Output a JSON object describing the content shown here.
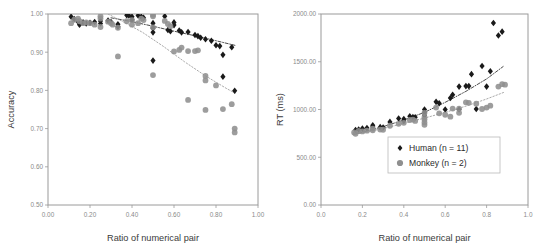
{
  "figure": {
    "background": "#ffffff",
    "human_color": "#1a1a1a",
    "monkey_color": "#8f8f8f",
    "frame_color": "#9a9a9a",
    "tick_color": "#8a8a8a"
  },
  "legend": {
    "position": "inside-bottom-right",
    "entries": [
      {
        "label": "Human (n = 11)",
        "marker": "diamond",
        "color": "#1a1a1a"
      },
      {
        "label": "Monkey (n = 2)",
        "marker": "circle",
        "color": "#8f8f8f"
      }
    ]
  },
  "chart_data": [
    {
      "type": "scatter",
      "panel": "left",
      "title": "",
      "xlabel": "Ratio of numerical pair",
      "ylabel": "Accuracy",
      "xlim": [
        0.0,
        1.0
      ],
      "ylim": [
        0.5,
        1.0
      ],
      "xticks": [
        0.0,
        0.2,
        0.4,
        0.6,
        0.8,
        1.0
      ],
      "xticklabels": [
        "0.00",
        "0.20",
        "0.40",
        "0.60",
        "0.80",
        "1.00"
      ],
      "yticks": [
        0.5,
        0.6,
        0.7,
        0.8,
        0.9,
        1.0
      ],
      "yticklabels": [
        "0.50",
        "0.60",
        "0.70",
        "0.80",
        "0.90",
        "1.00"
      ],
      "grid": false,
      "series": [
        {
          "name": "Human (n = 11)",
          "marker": "diamond",
          "color": "#1a1a1a",
          "points": [
            [
              0.11,
              0.993
            ],
            [
              0.125,
              0.987
            ],
            [
              0.143,
              0.98
            ],
            [
              0.15,
              0.972
            ],
            [
              0.167,
              0.978
            ],
            [
              0.182,
              0.975
            ],
            [
              0.2,
              0.977
            ],
            [
              0.222,
              0.979
            ],
            [
              0.25,
              0.982
            ],
            [
              0.25,
              0.975
            ],
            [
              0.286,
              0.983
            ],
            [
              0.3,
              0.979
            ],
            [
              0.333,
              0.973
            ],
            [
              0.333,
              0.967
            ],
            [
              0.375,
              0.997
            ],
            [
              0.385,
              0.996
            ],
            [
              0.4,
              0.993
            ],
            [
              0.4,
              0.985
            ],
            [
              0.429,
              0.996
            ],
            [
              0.444,
              0.993
            ],
            [
              0.455,
              0.99
            ],
            [
              0.5,
              0.976
            ],
            [
              0.5,
              0.963
            ],
            [
              0.5,
              0.952
            ],
            [
              0.5,
              0.878
            ],
            [
              0.556,
              0.994
            ],
            [
              0.571,
              0.958
            ],
            [
              0.583,
              0.955
            ],
            [
              0.6,
              0.978
            ],
            [
              0.6,
              0.971
            ],
            [
              0.625,
              0.957
            ],
            [
              0.636,
              0.952
            ],
            [
              0.667,
              0.953
            ],
            [
              0.7,
              0.945
            ],
            [
              0.714,
              0.942
            ],
            [
              0.727,
              0.938
            ],
            [
              0.75,
              0.934
            ],
            [
              0.778,
              0.93
            ],
            [
              0.8,
              0.918
            ],
            [
              0.818,
              0.916
            ],
            [
              0.833,
              0.893
            ],
            [
              0.833,
              0.836
            ],
            [
              0.875,
              0.913
            ],
            [
              0.889,
              0.799
            ]
          ]
        },
        {
          "name": "Monkey (n = 2)",
          "marker": "circle",
          "color": "#8f8f8f",
          "points": [
            [
              0.11,
              0.976
            ],
            [
              0.125,
              0.985
            ],
            [
              0.143,
              0.988
            ],
            [
              0.15,
              0.981
            ],
            [
              0.167,
              0.976
            ],
            [
              0.182,
              0.978
            ],
            [
              0.2,
              0.976
            ],
            [
              0.222,
              0.972
            ],
            [
              0.25,
              0.994
            ],
            [
              0.25,
              0.988
            ],
            [
              0.25,
              0.966
            ],
            [
              0.286,
              0.98
            ],
            [
              0.3,
              0.976
            ],
            [
              0.308,
              0.972
            ],
            [
              0.333,
              0.964
            ],
            [
              0.333,
              0.889
            ],
            [
              0.375,
              0.981
            ],
            [
              0.4,
              0.984
            ],
            [
              0.4,
              0.972
            ],
            [
              0.429,
              0.976
            ],
            [
              0.444,
              0.988
            ],
            [
              0.455,
              0.984
            ],
            [
              0.5,
              0.998
            ],
            [
              0.5,
              0.994
            ],
            [
              0.5,
              0.965
            ],
            [
              0.5,
              0.84
            ],
            [
              0.556,
              0.982
            ],
            [
              0.571,
              0.974
            ],
            [
              0.583,
              0.968
            ],
            [
              0.6,
              0.902
            ],
            [
              0.625,
              0.906
            ],
            [
              0.636,
              0.912
            ],
            [
              0.667,
              0.903
            ],
            [
              0.667,
              0.775
            ],
            [
              0.7,
              0.903
            ],
            [
              0.714,
              0.905
            ],
            [
              0.75,
              0.838
            ],
            [
              0.75,
              0.826
            ],
            [
              0.75,
              0.749
            ],
            [
              0.8,
              0.813
            ],
            [
              0.833,
              0.751
            ],
            [
              0.875,
              0.764
            ],
            [
              0.889,
              0.7
            ],
            [
              0.889,
              0.69
            ]
          ]
        }
      ],
      "trendlines": [
        {
          "name": "Human trend",
          "style": "dash-dot",
          "color": "#2b2b2b",
          "points": [
            [
              0.3,
              0.99
            ],
            [
              0.4,
              0.98
            ],
            [
              0.5,
              0.968
            ],
            [
              0.6,
              0.955
            ],
            [
              0.7,
              0.943
            ],
            [
              0.8,
              0.93
            ],
            [
              0.89,
              0.918
            ]
          ]
        },
        {
          "name": "Monkey trend",
          "style": "dotted",
          "color": "#9a9a9a",
          "points": [
            [
              0.16,
              1.035
            ],
            [
              0.25,
              1.01
            ],
            [
              0.35,
              0.982
            ],
            [
              0.45,
              0.952
            ],
            [
              0.55,
              0.915
            ],
            [
              0.65,
              0.875
            ],
            [
              0.75,
              0.838
            ],
            [
              0.85,
              0.805
            ],
            [
              0.89,
              0.793
            ]
          ]
        }
      ]
    },
    {
      "type": "scatter",
      "panel": "right",
      "title": "",
      "xlabel": "Ratio of numerical pair",
      "ylabel": "RT (ms)",
      "xlim": [
        0.0,
        1.0
      ],
      "ylim": [
        0.0,
        2000.0
      ],
      "xticks": [
        0.0,
        0.2,
        0.4,
        0.6,
        0.8,
        1.0
      ],
      "xticklabels": [
        "0.0",
        "0.2",
        "0.4",
        "0.6",
        "0.8",
        "1.0"
      ],
      "yticks": [
        0.0,
        500.0,
        1000.0,
        1500.0,
        2000.0
      ],
      "yticklabels": [
        "0.00",
        "500.00",
        "1000.00",
        "1500.00",
        "2000.00"
      ],
      "grid": false,
      "series": [
        {
          "name": "Human (n = 11)",
          "marker": "diamond",
          "color": "#1a1a1a",
          "points": [
            [
              0.167,
              785
            ],
            [
              0.182,
              790
            ],
            [
              0.2,
              800
            ],
            [
              0.222,
              805
            ],
            [
              0.25,
              835
            ],
            [
              0.25,
              820
            ],
            [
              0.286,
              815
            ],
            [
              0.3,
              812
            ],
            [
              0.333,
              870
            ],
            [
              0.375,
              905
            ],
            [
              0.4,
              900
            ],
            [
              0.4,
              880
            ],
            [
              0.429,
              930
            ],
            [
              0.444,
              920
            ],
            [
              0.455,
              918
            ],
            [
              0.5,
              1000
            ],
            [
              0.5,
              965
            ],
            [
              0.5,
              940
            ],
            [
              0.556,
              1080
            ],
            [
              0.571,
              1065
            ],
            [
              0.6,
              1000
            ],
            [
              0.625,
              1120
            ],
            [
              0.636,
              1155
            ],
            [
              0.667,
              1240
            ],
            [
              0.667,
              1000
            ],
            [
              0.7,
              1245
            ],
            [
              0.714,
              1245
            ],
            [
              0.727,
              1370
            ],
            [
              0.75,
              1005
            ],
            [
              0.778,
              1455
            ],
            [
              0.8,
              1240
            ],
            [
              0.818,
              1400
            ],
            [
              0.833,
              1905
            ],
            [
              0.857,
              1775
            ],
            [
              0.875,
              1815
            ]
          ]
        },
        {
          "name": "Monkey (n = 2)",
          "marker": "circle",
          "color": "#8f8f8f",
          "points": [
            [
              0.16,
              760
            ],
            [
              0.167,
              745
            ],
            [
              0.182,
              775
            ],
            [
              0.2,
              770
            ],
            [
              0.222,
              778
            ],
            [
              0.25,
              800
            ],
            [
              0.25,
              782
            ],
            [
              0.286,
              790
            ],
            [
              0.3,
              788
            ],
            [
              0.333,
              830
            ],
            [
              0.375,
              850
            ],
            [
              0.4,
              860
            ],
            [
              0.429,
              890
            ],
            [
              0.444,
              895
            ],
            [
              0.455,
              880
            ],
            [
              0.5,
              965
            ],
            [
              0.5,
              920
            ],
            [
              0.5,
              895
            ],
            [
              0.5,
              865
            ],
            [
              0.5,
              840
            ],
            [
              0.556,
              1020
            ],
            [
              0.571,
              960
            ],
            [
              0.6,
              945
            ],
            [
              0.625,
              925
            ],
            [
              0.636,
              1010
            ],
            [
              0.667,
              1010
            ],
            [
              0.667,
              965
            ],
            [
              0.7,
              1075
            ],
            [
              0.714,
              1070
            ],
            [
              0.75,
              1060
            ],
            [
              0.778,
              1005
            ],
            [
              0.8,
              1020
            ],
            [
              0.818,
              1040
            ],
            [
              0.857,
              1240
            ],
            [
              0.875,
              1265
            ],
            [
              0.889,
              1260
            ]
          ]
        }
      ],
      "trendlines": [
        {
          "name": "Human trend",
          "style": "dash-dot",
          "color": "#2b2b2b",
          "points": [
            [
              0.17,
              745
            ],
            [
              0.3,
              820
            ],
            [
              0.4,
              890
            ],
            [
              0.5,
              970
            ],
            [
              0.6,
              1075
            ],
            [
              0.7,
              1190
            ],
            [
              0.8,
              1320
            ],
            [
              0.88,
              1450
            ]
          ]
        },
        {
          "name": "Monkey trend",
          "style": "dotted",
          "color": "#9a9a9a",
          "points": [
            [
              0.17,
              745
            ],
            [
              0.3,
              800
            ],
            [
              0.4,
              855
            ],
            [
              0.5,
              910
            ],
            [
              0.6,
              970
            ],
            [
              0.7,
              1035
            ],
            [
              0.8,
              1110
            ],
            [
              0.89,
              1185
            ]
          ]
        }
      ]
    }
  ]
}
